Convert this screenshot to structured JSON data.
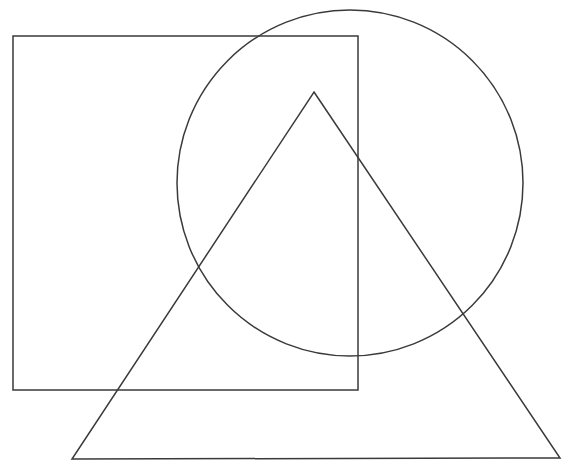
{
  "canvas": {
    "width": 575,
    "height": 470,
    "background_color": "#ffffff",
    "title": "Overlapping geometric outline shapes"
  },
  "style": {
    "stroke_color": "#3a3a3a",
    "stroke_width": 1.5,
    "fill": "none"
  },
  "shapes": [
    {
      "id": "rectangle",
      "name": "rectangle",
      "label": "Rectangle",
      "type": "rect",
      "x": 13,
      "y": 36,
      "width": 345,
      "height": 354,
      "corners": [
        [
          13,
          36
        ],
        [
          358,
          36
        ],
        [
          358,
          390
        ],
        [
          13,
          390
        ]
      ],
      "stroke_color": "#3a3a3a",
      "stroke_width": 1.5,
      "fill": "none"
    },
    {
      "id": "circle",
      "name": "circle",
      "label": "Circle",
      "type": "circle",
      "cx": 350,
      "cy": 183,
      "r": 173,
      "bounds": [
        177,
        10,
        523,
        356
      ],
      "stroke_color": "#3a3a3a",
      "stroke_width": 1.5,
      "fill": "none"
    },
    {
      "id": "triangle",
      "name": "triangle",
      "label": "Triangle",
      "type": "polygon",
      "points": "314,92 560,458 72,459",
      "vertices": [
        [
          314,
          92
        ],
        [
          560,
          458
        ],
        [
          72,
          459
        ]
      ],
      "stroke_color": "#3a3a3a",
      "stroke_width": 1.5,
      "fill": "none"
    }
  ]
}
